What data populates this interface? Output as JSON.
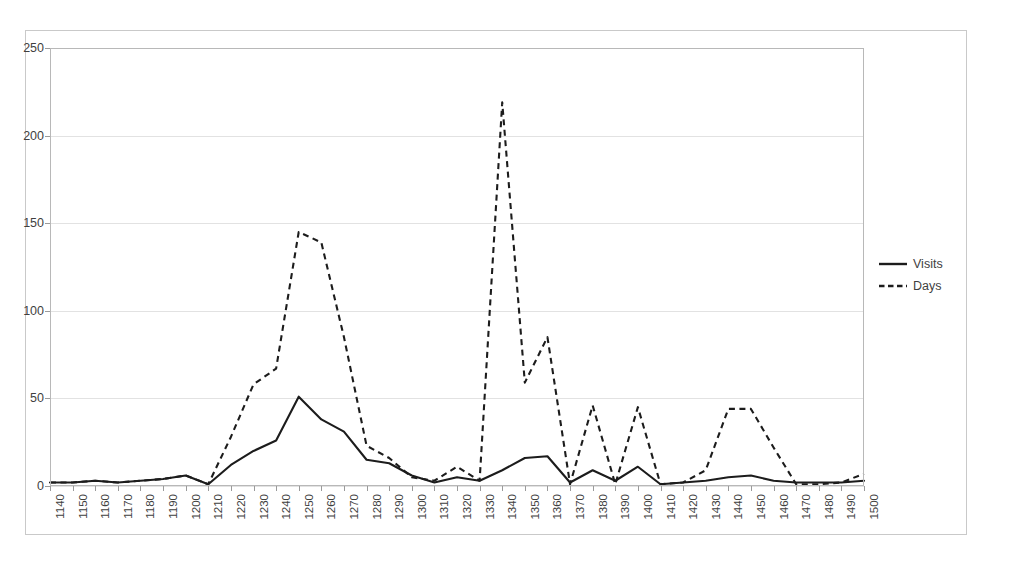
{
  "chart_data": {
    "type": "line",
    "title": "",
    "xlabel": "",
    "ylabel": "",
    "ylim": [
      0,
      250
    ],
    "yticks": [
      0,
      50,
      100,
      150,
      200,
      250
    ],
    "grid": true,
    "legend_position": "right",
    "categories": [
      "1140",
      "1150",
      "1160",
      "1170",
      "1180",
      "1190",
      "1200",
      "1210",
      "1220",
      "1230",
      "1240",
      "1250",
      "1260",
      "1270",
      "1280",
      "1290",
      "1300",
      "1310",
      "1320",
      "1330",
      "1340",
      "1350",
      "1360",
      "1370",
      "1380",
      "1390",
      "1400",
      "1410",
      "1420",
      "1430",
      "1440",
      "1450",
      "1460",
      "1470",
      "1480",
      "1490",
      "1500"
    ],
    "series": [
      {
        "name": "Visits",
        "style": "solid",
        "color": "#1c1c1c",
        "values": [
          2,
          2,
          3,
          2,
          3,
          4,
          6,
          1,
          12,
          20,
          26,
          51,
          38,
          31,
          15,
          13,
          6,
          2,
          5,
          3,
          9,
          16,
          17,
          2,
          9,
          3,
          11,
          1,
          2,
          3,
          5,
          6,
          3,
          2,
          2,
          2,
          3
        ]
      },
      {
        "name": "Days",
        "style": "dashed",
        "color": "#1c1c1c",
        "values": [
          2,
          2,
          3,
          2,
          3,
          4,
          6,
          1,
          28,
          58,
          67,
          145,
          139,
          85,
          23,
          16,
          5,
          3,
          11,
          3,
          219,
          59,
          85,
          1,
          46,
          1,
          45,
          1,
          2,
          9,
          44,
          44,
          22,
          1,
          1,
          2,
          7
        ]
      }
    ]
  },
  "legend": {
    "items": [
      {
        "label": "Visits",
        "style": "solid"
      },
      {
        "label": "Days",
        "style": "dashed"
      }
    ]
  }
}
